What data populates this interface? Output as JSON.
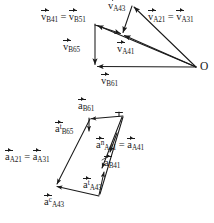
{
  "figure": {
    "background_color": "#ffffff",
    "line_color": "#1a1a1a",
    "text_color": "#1a1a1a"
  },
  "velocity_diagram": {
    "name": "velocity-polygon",
    "pole_label": "O",
    "labels": [
      {
        "id": "vB41-vB51",
        "symbol": "v",
        "sub": "B41",
        "sup": "",
        "equals": true,
        "symbol2": "v",
        "sub2": "B51",
        "sup2": "",
        "x": 41,
        "y": 12
      },
      {
        "id": "vA43",
        "symbol": "v",
        "sub": "A43",
        "sup": "",
        "equals": false,
        "x": 108,
        "y": 1
      },
      {
        "id": "vA21-vA31",
        "symbol": "v",
        "sub": "A21",
        "sup": "",
        "equals": true,
        "symbol2": "v",
        "sub2": "A31",
        "sup2": "",
        "x": 148,
        "y": 12
      },
      {
        "id": "vB65",
        "symbol": "v",
        "sub": "B65",
        "sup": "",
        "equals": false,
        "x": 63,
        "y": 42
      },
      {
        "id": "vA41",
        "symbol": "v",
        "sub": "A41",
        "sup": "",
        "equals": false,
        "x": 117,
        "y": 44
      },
      {
        "id": "vB61",
        "symbol": "v",
        "sub": "B61",
        "sup": "",
        "equals": false,
        "x": 101,
        "y": 76
      }
    ],
    "points": {
      "B_top": [
        95,
        24
      ],
      "B_bottom": [
        95,
        66
      ],
      "O": [
        196,
        67
      ],
      "A43_apex": [
        132,
        5
      ],
      "A41_mid": [
        122,
        34
      ]
    }
  },
  "acceleration_diagram": {
    "name": "acceleration-polygon",
    "labels": [
      {
        "id": "aB61",
        "symbol": "a",
        "sub": "B61",
        "sup": "",
        "equals": false,
        "x": 78,
        "y": 101
      },
      {
        "id": "aB65t",
        "symbol": "a",
        "sub": "B65",
        "sup": "t",
        "equals": false,
        "x": 55,
        "y": 124
      },
      {
        "id": "aA41n-aA41",
        "symbol": "a",
        "sub": "A41",
        "sup": "n",
        "equals": true,
        "symbol2": "a",
        "sub2": "A41",
        "sup2": "",
        "x": 96,
        "y": 140
      },
      {
        "id": "aB41",
        "symbol": "a",
        "sub": "B41",
        "sup": "",
        "equals": false,
        "x": 104,
        "y": 158
      },
      {
        "id": "aA21-aA31",
        "symbol": "a",
        "sub": "A21",
        "sup": "",
        "equals": true,
        "symbol2": "a",
        "sub2": "A31",
        "sup2": "",
        "x": 5,
        "y": 152
      },
      {
        "id": "aA43t",
        "symbol": "a",
        "sub": "A43",
        "sup": "t",
        "equals": false,
        "x": 83,
        "y": 180
      },
      {
        "id": "aA43c",
        "symbol": "a",
        "sub": "A43",
        "sup": "c",
        "equals": false,
        "x": 44,
        "y": 197
      }
    ],
    "points": {
      "top_left": [
        89,
        119
      ],
      "top_right": [
        123,
        116
      ],
      "bottom_left": [
        55,
        186
      ],
      "bottom_mid": [
        99,
        196
      ],
      "mid_a": [
        103,
        163
      ],
      "mid_b": [
        106,
        155
      ],
      "mid_c": [
        109,
        147
      ]
    }
  }
}
